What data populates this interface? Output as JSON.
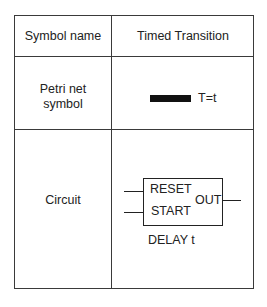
{
  "table": {
    "header": {
      "left": "Symbol name",
      "right": "Timed Transition"
    },
    "rows": [
      {
        "label_line1": "Petri net",
        "label_line2": "symbol",
        "symbol": {
          "icon": "filled-bar-transition-icon",
          "text": "T=t"
        }
      },
      {
        "label": "Circuit",
        "block": {
          "inputs": [
            "RESET",
            "START"
          ],
          "output": "OUT",
          "caption": "DELAY t"
        }
      }
    ]
  },
  "colors": {
    "line": "#3a3a3a",
    "text": "#222222",
    "bar": "#111111",
    "background": "#ffffff"
  }
}
